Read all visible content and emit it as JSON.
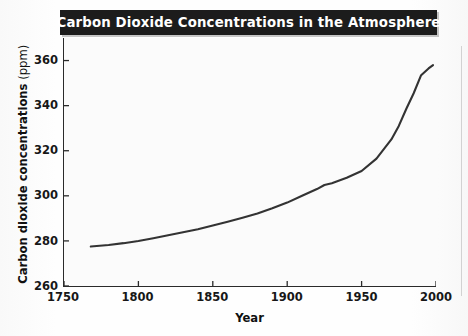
{
  "figure": {
    "title": "Carbon Dioxide Concentrations in the Atmosphere",
    "title_background": "#1c1c1c",
    "title_color": "#ffffff",
    "plot_background": "#fbfbfb",
    "axis_color": "#2a2a2a",
    "line_color": "#333333"
  },
  "axes": {
    "ylabel_main": "Carbon dioxide concentrations",
    "ylabel_unit": " (ppm)",
    "xlabel": "Year",
    "yticks": [
      "260",
      "280",
      "300",
      "320",
      "340",
      "360"
    ],
    "xticks": [
      "1750",
      "1800",
      "1850",
      "1900",
      "1950",
      "2000"
    ]
  },
  "chart_data": {
    "type": "line",
    "title": "Carbon Dioxide Concentrations in the Atmosphere",
    "xlabel": "Year",
    "ylabel": "Carbon dioxide concentrations (ppm)",
    "xlim": [
      1750,
      2000
    ],
    "ylim": [
      260,
      370
    ],
    "ytick_values": [
      260,
      280,
      300,
      320,
      340,
      360
    ],
    "xtick_values": [
      1750,
      1800,
      1850,
      1900,
      1950,
      2000
    ],
    "grid": false,
    "legend": null,
    "series": [
      {
        "name": "Atmospheric CO2 concentration",
        "color": "#333333",
        "x": [
          1768,
          1780,
          1790,
          1800,
          1810,
          1820,
          1830,
          1840,
          1850,
          1860,
          1870,
          1880,
          1890,
          1900,
          1910,
          1920,
          1925,
          1930,
          1940,
          1950,
          1960,
          1970,
          1975,
          1980,
          1985,
          1990,
          1995,
          1998
        ],
        "y": [
          277.5,
          278.2,
          279.0,
          280.0,
          281.2,
          282.5,
          283.8,
          285.2,
          286.8,
          288.5,
          290.3,
          292.2,
          294.5,
          297.0,
          300.0,
          303.0,
          304.8,
          305.6,
          308.0,
          311.0,
          316.5,
          325.0,
          331.0,
          338.5,
          345.5,
          353.5,
          356.5,
          358.0
        ]
      }
    ]
  }
}
